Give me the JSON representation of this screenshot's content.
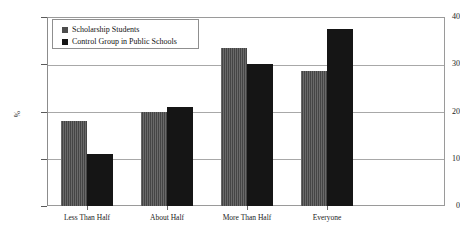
{
  "chart_data": {
    "type": "bar",
    "title": "",
    "xlabel": "",
    "ylabel": "%",
    "ylim": [
      0,
      40
    ],
    "yticks": [
      0,
      10,
      20,
      30,
      40
    ],
    "ytick_labels": [
      "0",
      "10",
      "20",
      "30",
      "40"
    ],
    "grid": true,
    "legend_position": "top-left",
    "categories": [
      "Less Than Half",
      "About Half",
      "More Than Half",
      "Everyone"
    ],
    "series": [
      {
        "name": "Scholarship Students",
        "color": "#4d4d4d",
        "values": [
          18,
          20,
          33.5,
          28.5
        ]
      },
      {
        "name": "Control Group in Public Schools",
        "color": "#151515",
        "values": [
          11,
          21,
          30,
          37.5
        ]
      }
    ]
  }
}
